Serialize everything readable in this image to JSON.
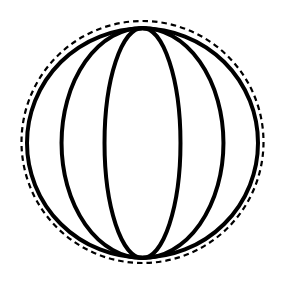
{
  "figure": {
    "type": "line-diagram",
    "canvas": {
      "width": 284,
      "height": 293,
      "background_color": "#ffffff"
    },
    "stroke_color": "#000000",
    "elements": {
      "sphere_outline": {
        "name": "sphere-outline-circle",
        "shape": "ellipse",
        "cx": 142.5,
        "cy": 143,
        "rx": 115.5,
        "ry": 114.5,
        "stroke_width": 4,
        "style": "solid"
      },
      "dashed_circle": {
        "name": "dashed-bounding-circle",
        "shape": "ellipse",
        "cx": 142.5,
        "cy": 142,
        "rx": 121,
        "ry": 121,
        "stroke_width": 2.2,
        "style": "dashed",
        "dash_length": 5.5,
        "dash_gap": 4
      },
      "poles": {
        "north": {
          "x": 142.5,
          "y": 28
        },
        "south": {
          "x": 142.5,
          "y": 258
        }
      },
      "meridians": [
        {
          "name": "meridian-outer-left",
          "half_width": 81,
          "mid_x": 61.5,
          "side": "left",
          "stroke_width": 4
        },
        {
          "name": "meridian-inner-left",
          "half_width": 38,
          "mid_x": 104.5,
          "side": "left",
          "stroke_width": 4
        },
        {
          "name": "meridian-inner-right",
          "half_width": 38,
          "mid_x": 180.5,
          "side": "right",
          "stroke_width": 4
        },
        {
          "name": "meridian-outer-right",
          "half_width": 81,
          "mid_x": 223.5,
          "side": "right",
          "stroke_width": 4
        }
      ],
      "meridian_count": 4
    }
  },
  "chart_data": {
    "type": "line",
    "xlabel": "",
    "ylabel": "",
    "xlim": [
      0,
      284
    ],
    "ylim": [
      293,
      0
    ],
    "grid": false,
    "legend": "none",
    "annotations": [],
    "series": [
      {
        "name": "sphere-outline",
        "style": "solid",
        "color": "#000000",
        "geometry": "ellipse",
        "cx": 142.5,
        "cy": 143,
        "rx": 115.5,
        "ry": 114.5
      },
      {
        "name": "dashed-bounding-circle",
        "style": "dashed",
        "color": "#000000",
        "geometry": "ellipse",
        "cx": 142.5,
        "cy": 142,
        "rx": 121,
        "ry": 121
      },
      {
        "name": "meridian-outer-left",
        "style": "solid",
        "color": "#000000",
        "geometry": "meridian-arc",
        "pole_top_y": 28,
        "pole_bottom_y": 258,
        "pole_x": 142.5,
        "extreme_x": 61.5
      },
      {
        "name": "meridian-inner-left",
        "style": "solid",
        "color": "#000000",
        "geometry": "meridian-arc",
        "pole_top_y": 28,
        "pole_bottom_y": 258,
        "pole_x": 142.5,
        "extreme_x": 104.5
      },
      {
        "name": "meridian-inner-right",
        "style": "solid",
        "color": "#000000",
        "geometry": "meridian-arc",
        "pole_top_y": 28,
        "pole_bottom_y": 258,
        "pole_x": 142.5,
        "extreme_x": 180.5
      },
      {
        "name": "meridian-outer-right",
        "style": "solid",
        "color": "#000000",
        "geometry": "meridian-arc",
        "pole_top_y": 28,
        "pole_bottom_y": 258,
        "pole_x": 142.5,
        "extreme_x": 223.5
      }
    ]
  }
}
